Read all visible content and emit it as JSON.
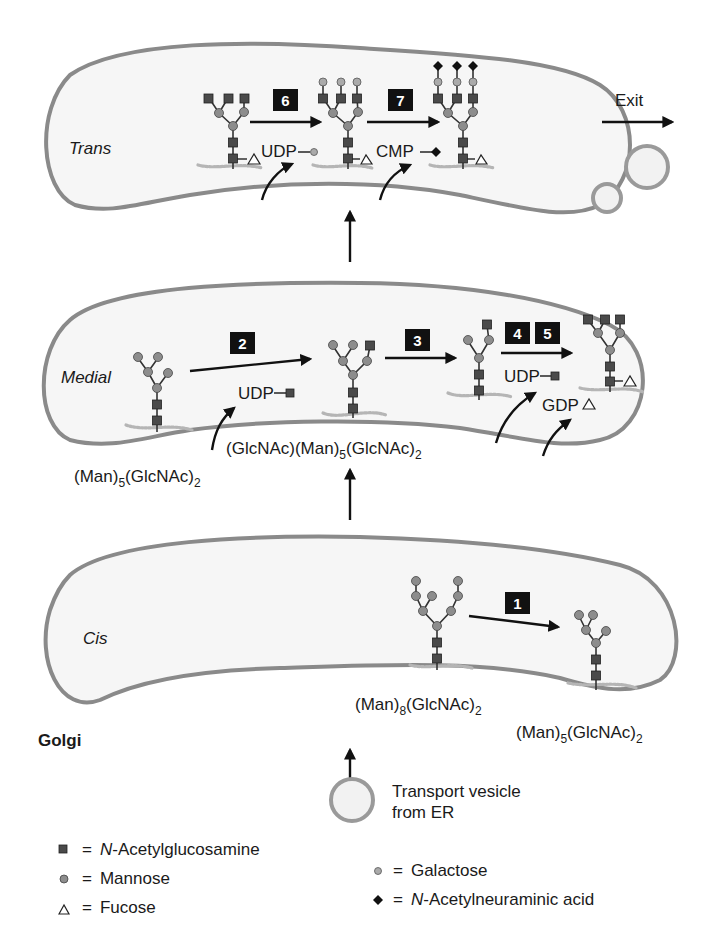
{
  "title": "Golgi",
  "compartments": {
    "trans": {
      "label": "Trans"
    },
    "medial": {
      "label": "Medial"
    },
    "cis": {
      "label": "Cis"
    }
  },
  "steps": [
    {
      "id": "1",
      "label": "1",
      "compartment": "cis"
    },
    {
      "id": "2",
      "label": "2",
      "compartment": "medial"
    },
    {
      "id": "3",
      "label": "3",
      "compartment": "medial"
    },
    {
      "id": "4",
      "label": "4",
      "compartment": "medial"
    },
    {
      "id": "5",
      "label": "5",
      "compartment": "medial"
    },
    {
      "id": "6",
      "label": "6",
      "compartment": "trans"
    },
    {
      "id": "7",
      "label": "7",
      "compartment": "trans"
    }
  ],
  "donors": {
    "udp_gal": "UDP",
    "cmp_neu": "CMP",
    "udp_glcnac_2": "UDP",
    "udp_glcnac_45": "UDP",
    "gdp_fuc": "GDP"
  },
  "intermediates": {
    "man8": {
      "prefix": "(Man)",
      "sub1": "8",
      "mid": "(GlcNAc)",
      "sub2": "2"
    },
    "man5_cis": {
      "prefix": "(Man)",
      "sub1": "5",
      "mid": "(GlcNAc)",
      "sub2": "2"
    },
    "man5_medial": {
      "prefix": "(Man)",
      "sub1": "5",
      "mid": "(GlcNAc)",
      "sub2": "2"
    },
    "glcnac_man5": {
      "prefix": "(GlcNAc)(Man)",
      "sub1": "5",
      "mid": "(GlcNAc)",
      "sub2": "2"
    }
  },
  "exit_label": "Exit",
  "vesicle": {
    "line1": "Transport vesicle",
    "line2": "from ER"
  },
  "legend": [
    {
      "symbol": "square",
      "italic_prefix": "N",
      "text": "-Acetylglucosamine",
      "eq": "="
    },
    {
      "symbol": "circle-dark",
      "italic_prefix": "",
      "text": "Mannose",
      "eq": "="
    },
    {
      "symbol": "triangle",
      "italic_prefix": "",
      "text": "Fucose",
      "eq": "="
    },
    {
      "symbol": "circle-light",
      "italic_prefix": "",
      "text": "Galactose",
      "eq": "="
    },
    {
      "symbol": "diamond",
      "italic_prefix": "N",
      "text": "-Acetylneuraminic acid",
      "eq": "="
    }
  ],
  "colors": {
    "membrane": "#8a8a8a",
    "lumen": "#f6f6f6",
    "badge": "#111111",
    "glcnac": "#4a4a4a",
    "mannose": "#8d8d8d",
    "galactose": "#aaaaaa"
  }
}
